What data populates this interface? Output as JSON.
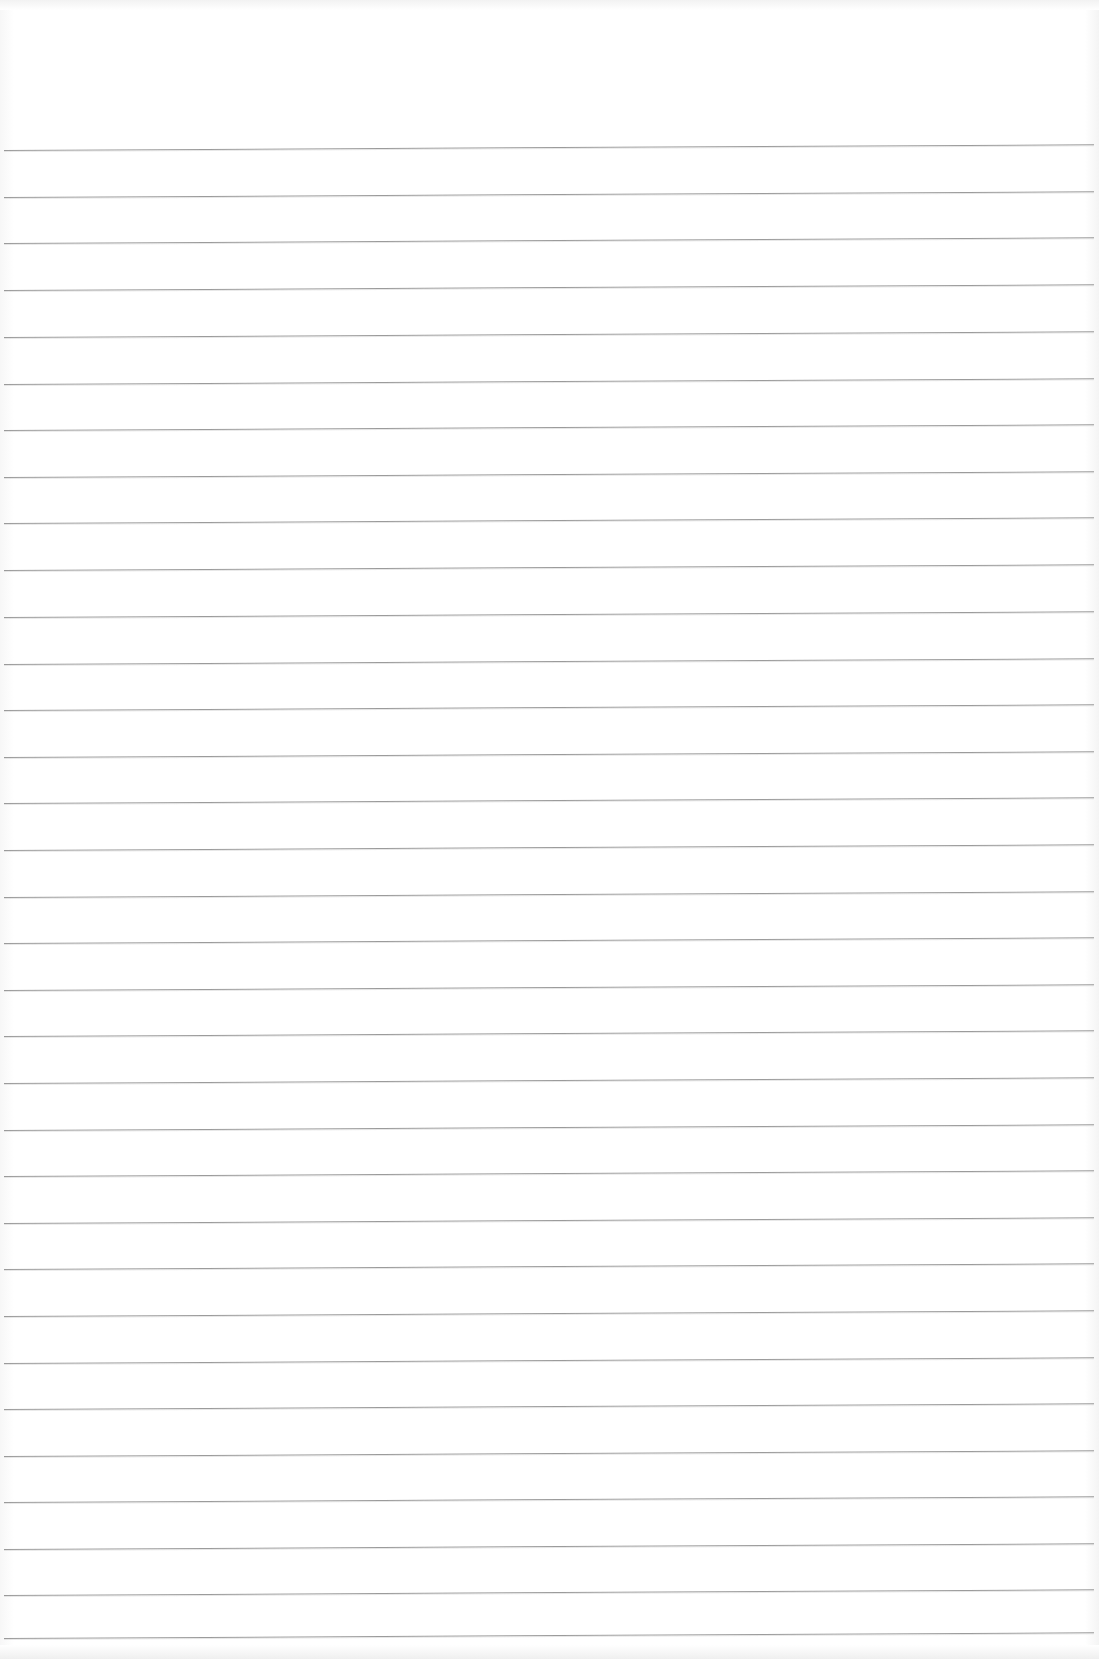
{
  "document": {
    "type": "ruled-paper-sheet",
    "background_color": "#ffffff",
    "rule_color": "#8a8a8a",
    "rule_count": 33,
    "first_rule_y": 150,
    "rule_spacing_px": 46.6,
    "rules_y": [
      150,
      197,
      243,
      290,
      337,
      384,
      430,
      477,
      523,
      570,
      617,
      664,
      710,
      757,
      803,
      850,
      897,
      943,
      990,
      1036,
      1083,
      1130,
      1176,
      1223,
      1269,
      1316,
      1363,
      1409,
      1456,
      1502,
      1549,
      1595,
      1638
    ]
  }
}
